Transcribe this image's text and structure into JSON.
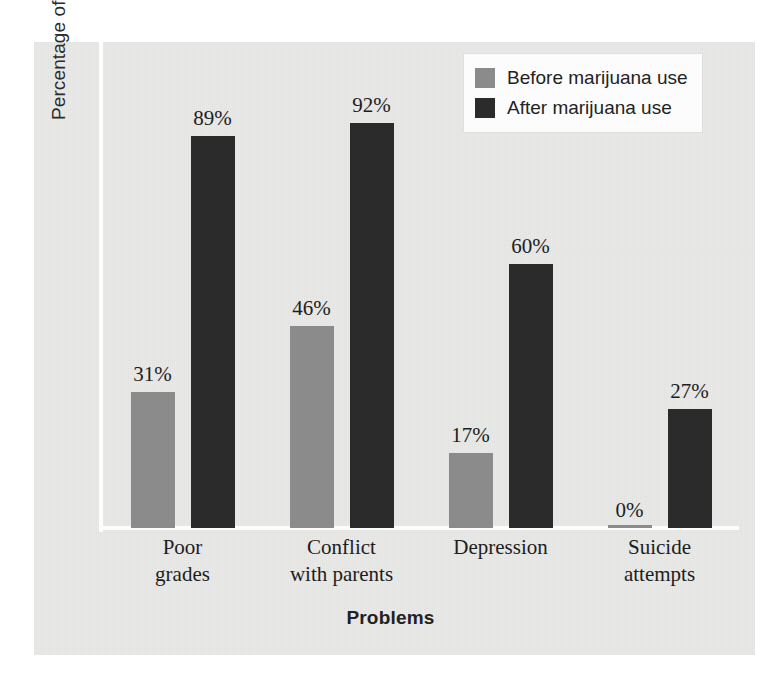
{
  "chart_data": {
    "type": "bar",
    "title": "",
    "xlabel": "Problems",
    "ylabel": "Percentage of students with problem",
    "categories": [
      "Poor grades",
      "Conflict with parents",
      "Depression",
      "Suicide attempts"
    ],
    "category_lines": [
      [
        "Poor",
        "grades"
      ],
      [
        "Conflict",
        "with parents"
      ],
      [
        "Depression",
        ""
      ],
      [
        "Suicide",
        "attempts"
      ]
    ],
    "series": [
      {
        "name": "Before marijuana use",
        "color": "#8b8b8b",
        "values": [
          31,
          46,
          17,
          0
        ],
        "labels": [
          "31%",
          "46%",
          "17%",
          "0%"
        ]
      },
      {
        "name": "After marijuana use",
        "color": "#2b2b2b",
        "values": [
          89,
          92,
          60,
          27
        ],
        "labels": [
          "89%",
          "92%",
          "60%",
          "27%"
        ]
      }
    ],
    "ylim": [
      0,
      100
    ],
    "grid": false,
    "legend_position": "top-right",
    "value_labels_shown": true,
    "axis_tick_labels": []
  },
  "legend": {
    "items": [
      {
        "label": "Before marijuana use",
        "swatch": "before"
      },
      {
        "label": "After marijuana use",
        "swatch": "after"
      }
    ]
  },
  "colors": {
    "panel_background": "#e9e9e7",
    "page_background": "#ffffff",
    "axis_line": "#fdfdfd",
    "before_bar": "#8b8b8b",
    "after_bar": "#2b2b2b",
    "text": "#1d1d1d"
  }
}
